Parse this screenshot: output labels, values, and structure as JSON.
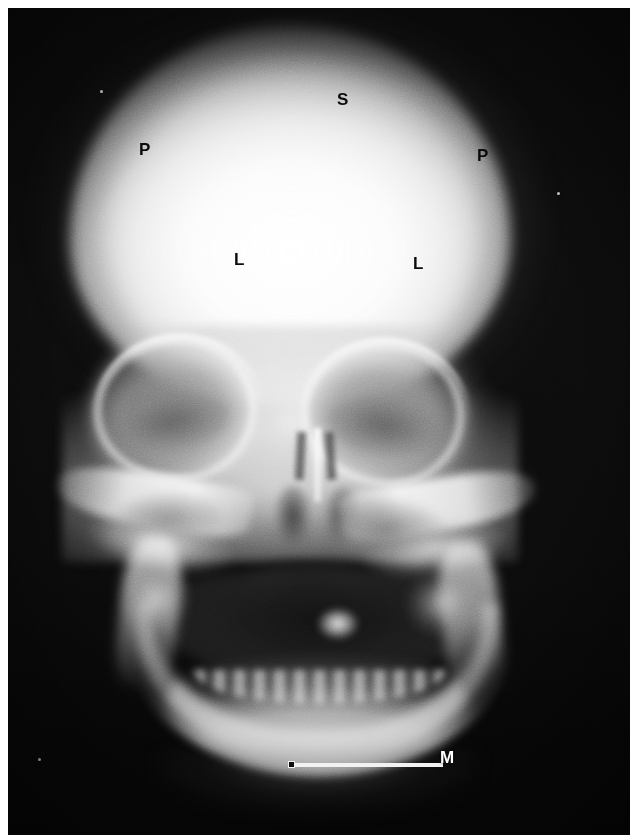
{
  "image": {
    "type": "radiograph",
    "modality": "X-ray",
    "view": "anteroposterior skull (AP / PA) projection",
    "subject": "human skull",
    "width": 630,
    "height": 839,
    "background_color": "#ffffff",
    "film_color": "#070707",
    "label_color": "#0b0b0b",
    "scale_bar_color": "#f2f2f2"
  },
  "annotations": [
    {
      "id": "label-s",
      "text": "S",
      "x": 337,
      "y": 91,
      "color": "dark",
      "region": "cranial-vault-superior"
    },
    {
      "id": "label-p-left",
      "text": "P",
      "x": 139,
      "y": 141,
      "color": "dark",
      "region": "parietal-bone-left"
    },
    {
      "id": "label-p-right",
      "text": "P",
      "x": 477,
      "y": 147,
      "color": "dark",
      "region": "parietal-bone-right"
    },
    {
      "id": "label-l-left",
      "text": "L",
      "x": 234,
      "y": 251,
      "color": "dark",
      "region": "cranial-vault-left"
    },
    {
      "id": "label-l-right",
      "text": "L",
      "x": 413,
      "y": 255,
      "color": "dark",
      "region": "cranial-vault-right"
    },
    {
      "id": "label-m",
      "text": "M",
      "x": 440,
      "y": 749,
      "color": "light",
      "region": "scale-bar-marker"
    }
  ],
  "scale_bar": {
    "name": "measurement-scale-bar",
    "x": 282,
    "y": 755,
    "length_px": 153,
    "thickness_px": 4,
    "end_marker": "square",
    "label": "M"
  },
  "anatomy_regions": [
    {
      "name": "cranial-vault",
      "description": "bright dome of the calvarium"
    },
    {
      "name": "orbit-left",
      "description": "left eye socket"
    },
    {
      "name": "orbit-right",
      "description": "right eye socket"
    },
    {
      "name": "nasal-cavity",
      "description": "nasal septum and turbinates"
    },
    {
      "name": "maxillary-sinus-left",
      "description": "left maxillary antrum"
    },
    {
      "name": "maxillary-sinus-right",
      "description": "right maxillary antrum"
    },
    {
      "name": "zygomatic-arch-left",
      "description": "left cheekbone arch"
    },
    {
      "name": "zygomatic-arch-right",
      "description": "right cheekbone arch"
    },
    {
      "name": "oral-cavity",
      "description": "radiolucent mouth / airway"
    },
    {
      "name": "mandible",
      "description": "lower jaw arch with dentition"
    },
    {
      "name": "petrous-ridge-left",
      "description": "left petrous temporal bone"
    },
    {
      "name": "petrous-ridge-right",
      "description": "right petrous temporal bone"
    }
  ]
}
